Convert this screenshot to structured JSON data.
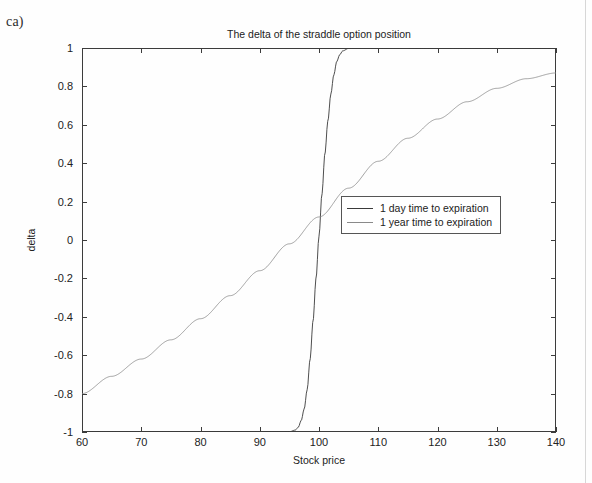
{
  "figure_label": "ca)",
  "chart_data": {
    "type": "line",
    "title": "The delta of the straddle option position",
    "xlabel": "Stock price",
    "ylabel": "delta",
    "xlim": [
      60,
      140
    ],
    "ylim": [
      -1,
      1
    ],
    "xticks": [
      60,
      70,
      80,
      90,
      100,
      110,
      120,
      130,
      140
    ],
    "yticks": [
      1,
      0.8,
      0.6,
      0.4,
      0.2,
      0,
      -0.2,
      -0.4,
      -0.6,
      -0.8,
      -1
    ],
    "grid": false,
    "legend_position": "center",
    "series": [
      {
        "name": "1 day time to expiration",
        "color": "#3a3a3a",
        "x": [
          60,
          70,
          80,
          85,
          90,
          92,
          94,
          95,
          96,
          96.5,
          97,
          97.5,
          98,
          98.5,
          99,
          99.5,
          100,
          100.5,
          101,
          101.5,
          102,
          102.5,
          103,
          103.5,
          104,
          105,
          106,
          110,
          120,
          130,
          140
        ],
        "y": [
          -1,
          -1,
          -1,
          -1,
          -1,
          -1,
          -1,
          -0.999,
          -0.99,
          -0.975,
          -0.94,
          -0.88,
          -0.78,
          -0.62,
          -0.42,
          -0.2,
          0.02,
          0.24,
          0.45,
          0.62,
          0.76,
          0.86,
          0.93,
          0.965,
          0.985,
          0.998,
          1,
          1,
          1,
          1,
          1
        ]
      },
      {
        "name": "1 year time to expiration",
        "color": "#8a8a8a",
        "x": [
          60,
          65,
          70,
          75,
          80,
          85,
          90,
          95,
          100,
          105,
          110,
          115,
          120,
          125,
          130,
          135,
          140
        ],
        "y": [
          -0.8,
          -0.71,
          -0.62,
          -0.52,
          -0.41,
          -0.29,
          -0.16,
          -0.02,
          0.12,
          0.27,
          0.41,
          0.53,
          0.63,
          0.72,
          0.79,
          0.84,
          0.87
        ]
      }
    ]
  },
  "legend": {
    "items": [
      {
        "label": "1 day time to expiration",
        "color": "#3a3a3a"
      },
      {
        "label": "1 year time to expiration",
        "color": "#8a8a8a"
      }
    ]
  }
}
